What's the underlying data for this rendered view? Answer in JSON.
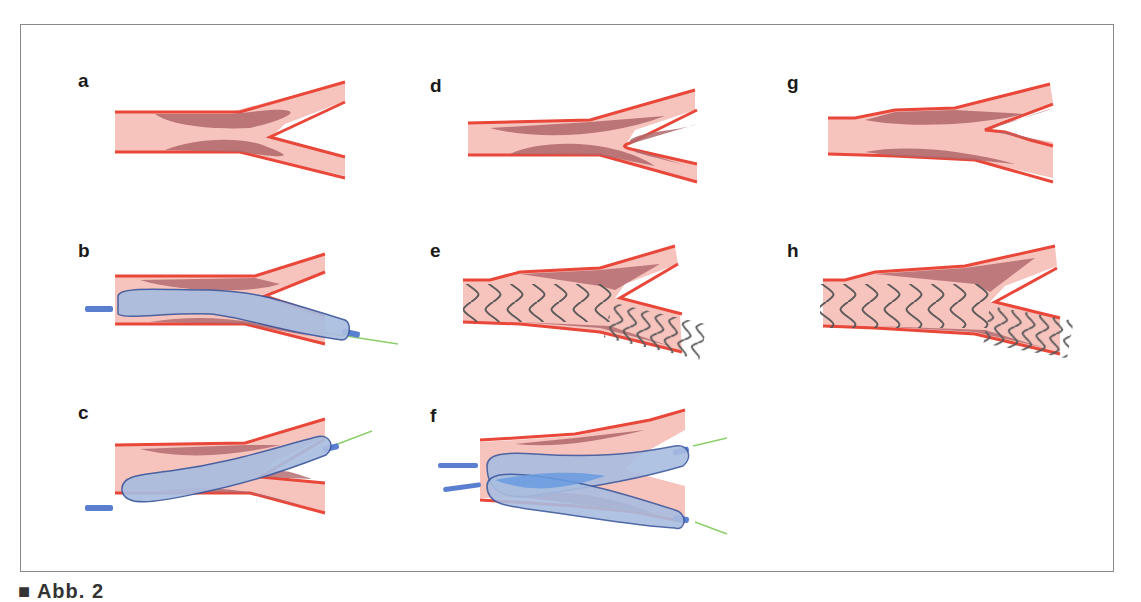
{
  "figure": {
    "panels": [
      {
        "id": "a",
        "label": "a",
        "content": "bifurcation-with-plaque"
      },
      {
        "id": "b",
        "label": "b",
        "content": "balloon-in-main-branch"
      },
      {
        "id": "c",
        "label": "c",
        "content": "balloon-in-side-branch"
      },
      {
        "id": "d",
        "label": "d",
        "content": "bifurcation-with-plaque"
      },
      {
        "id": "e",
        "label": "e",
        "content": "stent-main-branch"
      },
      {
        "id": "f",
        "label": "f",
        "content": "kissing-balloons"
      },
      {
        "id": "g",
        "label": "g",
        "content": "bifurcation-with-plaque"
      },
      {
        "id": "h",
        "label": "h",
        "content": "stent-main-branch"
      }
    ],
    "caption": "■ Abb. 2"
  },
  "colors": {
    "vessel_fill": "#f6c3bd",
    "vessel_wall": "#e8473a",
    "plaque": "#b0676b",
    "balloon_fill": "#a9bde0",
    "balloon_stroke": "#3d5a9e",
    "balloon_overlap": "#6a9be0",
    "catheter": "#5b7fd0",
    "guidewire": "#8ccf6a",
    "stent": "#555555",
    "frame": "#8a8a8a"
  }
}
